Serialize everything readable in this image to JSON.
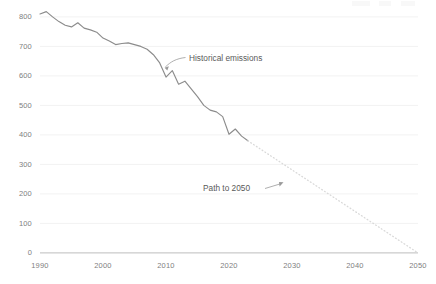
{
  "chart_data": {
    "type": "line",
    "title": "",
    "subtitle": "",
    "xlabel": "",
    "ylabel": "",
    "xlim": [
      1990,
      2050
    ],
    "ylim": [
      0,
      800
    ],
    "yticks": [
      0,
      100,
      200,
      300,
      400,
      500,
      600,
      700,
      800
    ],
    "xticks": [
      1990,
      2000,
      2010,
      2020,
      2030,
      2040,
      2050
    ],
    "grid": true,
    "legend_position": "none",
    "colors": {
      "historical_line": "#8c8c8c",
      "projection_line": "#d8d8d8",
      "gridline": "#f2f2f2",
      "baseline": "#bdbdbd",
      "tick_text": "#808080",
      "annotation_text": "#5a5a5a"
    },
    "series": [
      {
        "name": "Historical emissions",
        "style": "solid",
        "x": [
          1990,
          1991,
          1992,
          1993,
          1994,
          1995,
          1996,
          1997,
          1998,
          1999,
          2000,
          2001,
          2002,
          2003,
          2004,
          2005,
          2006,
          2007,
          2008,
          2009,
          2010,
          2011,
          2012,
          2013,
          2014,
          2015,
          2016,
          2017,
          2018,
          2019,
          2020,
          2021,
          2022,
          2023
        ],
        "values": [
          810,
          818,
          800,
          784,
          772,
          766,
          780,
          762,
          756,
          748,
          728,
          718,
          706,
          710,
          712,
          706,
          700,
          690,
          672,
          644,
          596,
          618,
          572,
          582,
          556,
          530,
          500,
          484,
          478,
          462,
          402,
          420,
          396,
          380
        ]
      },
      {
        "name": "Path to 2050",
        "style": "dotted",
        "x": [
          2023,
          2050
        ],
        "values": [
          380,
          0
        ]
      }
    ],
    "annotations": [
      {
        "text": "Historical emissions",
        "x": 2010,
        "y": 622,
        "leader": "curve-down-left"
      },
      {
        "text": "Path to 2050",
        "x": 2026,
        "y": 245,
        "leader": "arrow-up-right"
      }
    ]
  },
  "axis": {
    "y_tick_labels": [
      "800",
      "700",
      "600",
      "500",
      "400",
      "300",
      "200",
      "100",
      "0"
    ],
    "x_tick_labels": [
      "1990",
      "2000",
      "2010",
      "2020",
      "2030",
      "2040",
      "2050"
    ]
  },
  "annotations": {
    "historical": "Historical emissions",
    "projection": "Path to 2050"
  }
}
